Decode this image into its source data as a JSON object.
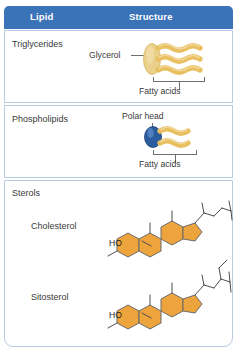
{
  "header": {
    "col_lipid": "Lipid",
    "col_structure": "Structure",
    "background_color": "#3b73b9",
    "text_color": "#ffffff"
  },
  "rows": [
    {
      "id": "triglycerides",
      "label": "Triglycerides",
      "annotations": {
        "glycerol": "Glycerol",
        "fatty_acids": "Fatty acids"
      },
      "art": {
        "glycerol_shape": "oval",
        "glycerol_color": "#e9c878",
        "fatty_acid_chains": 3,
        "fatty_acid_color": "#e9c060"
      }
    },
    {
      "id": "phospholipids",
      "label": "Phospholipids",
      "annotations": {
        "polar_head": "Polar head",
        "fatty_acids": "Fatty acids"
      },
      "art": {
        "head_shape": "circle",
        "head_color": "#2b5c9e",
        "fatty_acid_chains": 2,
        "fatty_acid_color": "#e9c060"
      }
    },
    {
      "id": "sterols",
      "label": "Sterols",
      "members": [
        {
          "id": "cholesterol",
          "label": "Cholesterol",
          "hydroxyl_label": "HO",
          "ring_color": "#eda43c",
          "side_chain": "isooctyl"
        },
        {
          "id": "sitosterol",
          "label": "Sitosterol",
          "hydroxyl_label": "HO",
          "ring_color": "#eda43c",
          "side_chain": "ethyl-branched-isooctyl"
        }
      ]
    }
  ],
  "colors": {
    "header_blue": "#3b73b9",
    "border_blue": "#b9cbe0",
    "lipid_gold": "#e9c060",
    "sterol_orange": "#eda43c",
    "polar_head_blue": "#2b5c9e",
    "text_gray": "#3a3a3a",
    "leader_gray": "#6f6f6f"
  }
}
